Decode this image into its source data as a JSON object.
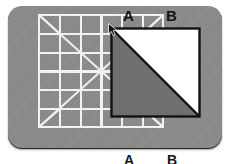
{
  "scene": {
    "panel": {
      "background_color": "#8c8c8c",
      "border_radius_px": 14,
      "texture": "diagonal-hatch"
    },
    "grid": {
      "columns": 6,
      "rows": 6,
      "line_color": "#f2f2f2",
      "diagonals": [
        "main-diagonal-top-left-to-bottom-right",
        "anti-diagonal-bottom-left-to-top-right",
        "cell-corner-diagonals"
      ]
    },
    "figure": {
      "shape": "square-split-by-diagonal",
      "outline_color": "#111111",
      "region_a_label": "A",
      "region_a_color": "#6f6f6f",
      "region_a_position": "lower-left-triangle",
      "region_b_label": "B",
      "region_b_color": "#ffffff",
      "region_b_position": "upper-right-triangle"
    },
    "cursor": {
      "icon": "arrow-pointer-icon",
      "anchor": "figure-top-left-corner"
    }
  },
  "labels": {
    "top": {
      "a": "A",
      "b": "B"
    },
    "bottom": {
      "a": "A",
      "b": "B"
    }
  }
}
